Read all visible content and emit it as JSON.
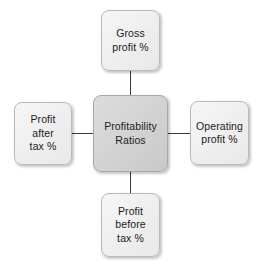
{
  "diagram": {
    "type": "hub-and-spoke",
    "title": "Profitability Ratios",
    "background_color": "#ffffff",
    "hub": {
      "label": "Profitability\nRatios",
      "fill_color": "#d4d4d4",
      "border_color": "#a8a8a8"
    },
    "satellites": [
      {
        "position": "top",
        "label": "Gross\nprofit %",
        "fill_color": "#eeeeee",
        "border_color": "#b9b9b9"
      },
      {
        "position": "right",
        "label": "Operating\nprofit %",
        "fill_color": "#eeeeee",
        "border_color": "#b9b9b9"
      },
      {
        "position": "bottom",
        "label": "Profit\nbefore\ntax %",
        "fill_color": "#eeeeee",
        "border_color": "#b9b9b9"
      },
      {
        "position": "left",
        "label": "Profit\nafter\ntax %",
        "fill_color": "#eeeeee",
        "border_color": "#b9b9b9"
      }
    ],
    "connector_color": "#3a3a3a",
    "text_color": "#1c1c1c"
  }
}
